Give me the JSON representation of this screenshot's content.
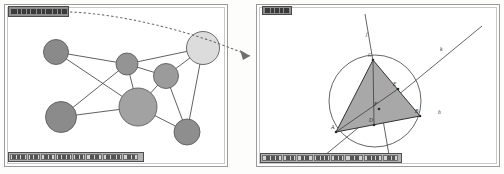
{
  "figure": {
    "caption": "",
    "panel_count": 2
  },
  "left_panel": {
    "name": "graph-window",
    "titlebar": {
      "text": "",
      "legible": false,
      "glyph_widths": [
        6,
        3,
        4,
        3,
        5,
        4,
        3,
        6,
        4,
        3,
        5
      ]
    },
    "toolbar": {
      "legible": false,
      "buttons": [
        {
          "label": "",
          "width": 17,
          "inks": [
            4,
            3,
            4
          ]
        },
        {
          "label": "",
          "width": 12,
          "inks": [
            3,
            4
          ]
        },
        {
          "label": "",
          "width": 14,
          "inks": [
            4,
            3
          ]
        },
        {
          "label": "",
          "width": 16,
          "inks": [
            3,
            4,
            3
          ]
        },
        {
          "label": "",
          "width": 12,
          "inks": [
            4,
            3
          ]
        },
        {
          "label": "",
          "width": 16,
          "inks": [
            4,
            4
          ]
        },
        {
          "label": "",
          "width": 19,
          "inks": [
            4,
            5,
            3
          ]
        },
        {
          "label": "",
          "width": 15,
          "inks": [
            4,
            3
          ]
        }
      ]
    },
    "graph": {
      "nodes": [
        {
          "id": "n1",
          "cx": 52,
          "cy": 48,
          "r": 12.5,
          "fill": "#8a8a8a"
        },
        {
          "id": "n2",
          "cx": 123,
          "cy": 60,
          "r": 11.0,
          "fill": "#949494"
        },
        {
          "id": "n3",
          "cx": 199,
          "cy": 44,
          "r": 16.5,
          "fill": "#dcdcdc"
        },
        {
          "id": "n4",
          "cx": 162,
          "cy": 72,
          "r": 12.5,
          "fill": "#9b9b9b"
        },
        {
          "id": "n5",
          "cx": 134,
          "cy": 103,
          "r": 19.0,
          "fill": "#a2a2a2"
        },
        {
          "id": "n6",
          "cx": 57,
          "cy": 113,
          "r": 15.5,
          "fill": "#8b8b8b"
        },
        {
          "id": "n7",
          "cx": 183,
          "cy": 128,
          "r": 13.0,
          "fill": "#8e8e8e"
        }
      ],
      "edges": [
        [
          "n1",
          "n2"
        ],
        [
          "n1",
          "n5"
        ],
        [
          "n2",
          "n3"
        ],
        [
          "n2",
          "n4"
        ],
        [
          "n2",
          "n5"
        ],
        [
          "n2",
          "n6"
        ],
        [
          "n3",
          "n4"
        ],
        [
          "n3",
          "n7"
        ],
        [
          "n4",
          "n5"
        ],
        [
          "n4",
          "n7"
        ],
        [
          "n5",
          "n6"
        ],
        [
          "n5",
          "n7"
        ]
      ],
      "highlighted_node": "n3"
    }
  },
  "right_panel": {
    "name": "geometry-window",
    "titlebar": {
      "text": "",
      "legible": false,
      "glyph_widths": [
        5,
        3,
        4,
        3,
        5
      ]
    },
    "toolbar": {
      "legible": false,
      "buttons": [
        {
          "label": "",
          "width": 20,
          "inks": [
            4,
            4,
            3
          ]
        },
        {
          "label": "",
          "width": 13,
          "inks": [
            4,
            3
          ]
        },
        {
          "label": "",
          "width": 16,
          "inks": [
            3,
            4
          ]
        },
        {
          "label": "",
          "width": 16,
          "inks": [
            4,
            3,
            3
          ]
        },
        {
          "label": "",
          "width": 13,
          "inks": [
            4,
            3
          ]
        },
        {
          "label": "",
          "width": 18,
          "inks": [
            4,
            4
          ]
        },
        {
          "label": "",
          "width": 18,
          "inks": [
            4,
            3,
            3
          ]
        },
        {
          "label": "",
          "width": 15,
          "inks": [
            4,
            3
          ]
        }
      ]
    },
    "geometry": {
      "circle": {
        "cx": 119,
        "cy": 97,
        "r": 46
      },
      "triangle": {
        "fill": "#a8a8a8",
        "vertices": [
          {
            "label": "A",
            "x": 80,
            "y": 128
          },
          {
            "label": "B",
            "x": 164,
            "y": 112
          },
          {
            "label": "C",
            "x": 117,
            "y": 56
          }
        ]
      },
      "points": [
        {
          "label": "E",
          "x": 142,
          "y": 85
        },
        {
          "label": "F",
          "x": 123,
          "y": 105
        },
        {
          "label": "D",
          "x": 118,
          "y": 121
        }
      ],
      "lines": [
        {
          "label": "j",
          "x1": 109,
          "y1": 10,
          "x2": 134,
          "y2": 157,
          "label_x": 110,
          "label_y": 32
        },
        {
          "label": "k",
          "x1": 63,
          "y1": 156,
          "x2": 226,
          "y2": 22,
          "label_x": 184,
          "label_y": 47
        }
      ],
      "marker": {
        "label": "h",
        "x": 182,
        "y": 110
      }
    }
  },
  "connector": {
    "name": "dashed-flow-arrow",
    "color": "#6f6f6f",
    "from_panel": "left_panel",
    "to_panel": "right_panel"
  }
}
